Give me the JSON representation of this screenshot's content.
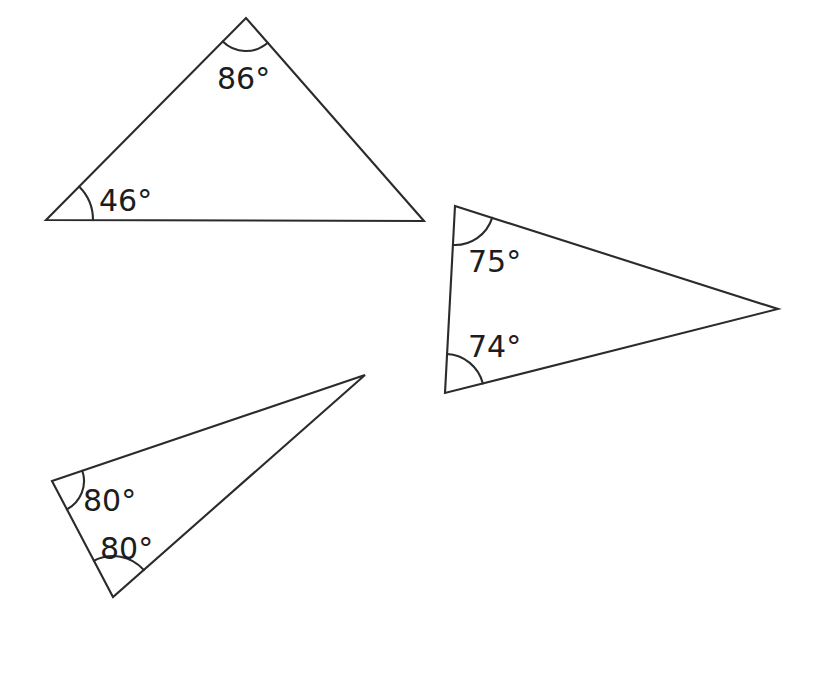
{
  "page": {
    "background_color": "#ffffff",
    "stroke_color": "#2b2b2b",
    "text_color": "#1d1d1d",
    "width": 829,
    "height": 673
  },
  "chart_data": {
    "type": "diagram",
    "subtype": "geometry-triangles",
    "title": "",
    "xlabel": "",
    "ylabel": "",
    "units": "degrees",
    "shape_count": 3,
    "shapes": [
      {
        "name": "triangle-1",
        "position": "top-left",
        "vertices": [
          {
            "id": "t1-left",
            "x": 46,
            "y": 220
          },
          {
            "id": "t1-apex",
            "x": 246,
            "y": 18
          },
          {
            "id": "t1-right",
            "x": 424,
            "y": 221
          }
        ],
        "labeled_angles": [
          {
            "at": "t1-apex",
            "value": "86",
            "label": "86°",
            "label_x": 217,
            "label_y": 89,
            "arc_radius": 33
          },
          {
            "at": "t1-left",
            "value": "46",
            "label": "46°",
            "label_x": 99,
            "label_y": 211,
            "arc_radius": 47
          }
        ]
      },
      {
        "name": "triangle-2",
        "position": "right",
        "vertices": [
          {
            "id": "t2-top",
            "x": 455,
            "y": 206
          },
          {
            "id": "t2-tip",
            "x": 778,
            "y": 309
          },
          {
            "id": "t2-bottom",
            "x": 445,
            "y": 393
          }
        ],
        "labeled_angles": [
          {
            "at": "t2-top",
            "value": "75",
            "label": "75°",
            "label_x": 468,
            "label_y": 272,
            "arc_radius": 39
          },
          {
            "at": "t2-bottom",
            "value": "74",
            "label": "74°",
            "label_x": 468,
            "label_y": 357,
            "arc_radius": 39
          }
        ]
      },
      {
        "name": "triangle-3",
        "position": "bottom-left",
        "vertices": [
          {
            "id": "t3-left",
            "x": 52,
            "y": 481
          },
          {
            "id": "t3-apex",
            "x": 365,
            "y": 375
          },
          {
            "id": "t3-bottom",
            "x": 113,
            "y": 597
          }
        ],
        "labeled_angles": [
          {
            "at": "t3-left",
            "value": "80",
            "label": "80°",
            "label_x": 83,
            "label_y": 511,
            "arc_radius": 32
          },
          {
            "at": "t3-bottom",
            "value": "80",
            "label": "80°",
            "label_x": 100,
            "label_y": 559,
            "arc_radius": 41
          }
        ]
      }
    ],
    "all_angle_labels": [
      "86°",
      "46°",
      "75°",
      "74°",
      "80°",
      "80°"
    ],
    "all_angle_values": [
      86,
      46,
      75,
      74,
      80,
      80
    ]
  }
}
